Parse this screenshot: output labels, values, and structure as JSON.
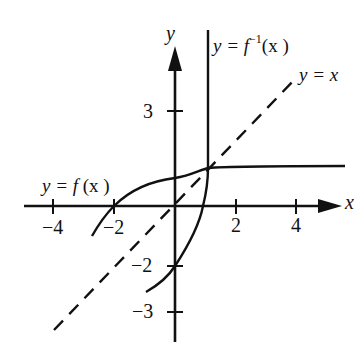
{
  "figure": {
    "type": "function and inverse graph",
    "axes": {
      "x_label": "x",
      "y_label": "y",
      "x_ticks": [
        {
          "value": -4,
          "label": "−4"
        },
        {
          "value": -2,
          "label": "−2"
        },
        {
          "value": 2,
          "label": "2"
        },
        {
          "value": 4,
          "label": "4"
        }
      ],
      "y_ticks": [
        {
          "value": 3,
          "label": "3"
        },
        {
          "value": -2,
          "label": "−2"
        },
        {
          "value": -3,
          "label": "−3"
        }
      ]
    },
    "curves": [
      {
        "name": "f",
        "label": "y = f (x)",
        "style": "solid"
      },
      {
        "name": "f_inverse",
        "label": "y = f⁻¹(x )",
        "style": "solid"
      },
      {
        "name": "identity",
        "label": "y = x",
        "style": "dashed"
      }
    ],
    "colors": {
      "ink": "#111111",
      "background": "#ffffff"
    }
  },
  "labels": {
    "x_axis": "x",
    "y_axis": "y",
    "tick_x_neg4": "−4",
    "tick_x_neg2": "−2",
    "tick_x_2": "2",
    "tick_x_4": "4",
    "tick_y_3": "3",
    "tick_y_neg2": "−2",
    "tick_y_neg3": "−3",
    "f_label_prefix": "y = f ",
    "f_label_suffix": "(x )",
    "finv_label_prefix": "y = f",
    "finv_label_sup": "−1",
    "finv_label_suffix": "(x )",
    "identity_label": "y = x"
  }
}
